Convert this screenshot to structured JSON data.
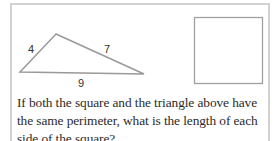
{
  "triangle": {
    "side_left": "4",
    "side_right": "7",
    "side_bottom": "9",
    "vertices": {
      "apex": [
        56,
        34
      ],
      "left": [
        20,
        72
      ],
      "right": [
        144,
        74
      ]
    }
  },
  "square": {
    "x": 194,
    "y": 17,
    "size": 68
  },
  "question": {
    "text": "If both the square and the triangle above have the same perimeter, what is the length of each side of the square?"
  },
  "colors": {
    "stroke": "#9a9a9a",
    "frame": "#d2d2d2",
    "text": "#2b2b2b"
  }
}
